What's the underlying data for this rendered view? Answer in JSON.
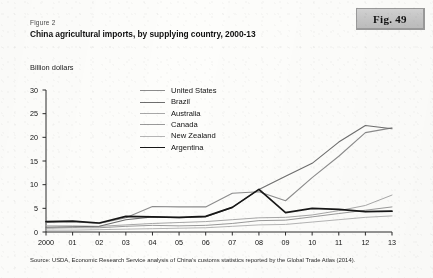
{
  "badge": {
    "label": "Fig. 49"
  },
  "figure_number": "Figure 2",
  "title": "China agricultural imports, by supplying country, 2000-13",
  "y_axis_title": "Billion dollars",
  "source_note": "Source: USDA, Economic Research Service analysis of China's customs statistics reported by the Global Trade Atlas (2014).",
  "chart_data": {
    "type": "line",
    "title": "China agricultural imports, by supplying country, 2000-13",
    "xlabel": "",
    "ylabel": "Billion dollars",
    "ylim": [
      0,
      30
    ],
    "yticks": [
      0,
      5,
      10,
      15,
      20,
      25,
      30
    ],
    "grid": false,
    "legend_position": "upper-left-inside",
    "x": [
      "2000",
      "01",
      "02",
      "03",
      "04",
      "05",
      "06",
      "07",
      "08",
      "09",
      "10",
      "11",
      "12",
      "13"
    ],
    "categories": [
      "2000",
      "01",
      "02",
      "03",
      "04",
      "05",
      "06",
      "07",
      "08",
      "09",
      "10",
      "11",
      "12",
      "13"
    ],
    "series": [
      {
        "name": "United States",
        "color": "#8c8c8c",
        "width": 1.1,
        "values": [
          2.0,
          2.2,
          1.8,
          3.0,
          5.4,
          5.3,
          5.3,
          8.2,
          8.5,
          6.6,
          11.5,
          16.0,
          21.0,
          22.0
        ]
      },
      {
        "name": "Brazil",
        "color": "#6e6e6e",
        "width": 1.1,
        "values": [
          1.0,
          1.1,
          1.2,
          2.6,
          3.2,
          3.0,
          3.2,
          5.2,
          9.0,
          11.8,
          14.5,
          19.0,
          22.5,
          21.8
        ]
      },
      {
        "name": "Australia",
        "color": "#a8a8a8",
        "width": 1.0,
        "values": [
          1.3,
          1.3,
          1.2,
          1.5,
          1.8,
          2.0,
          2.2,
          2.6,
          3.0,
          3.1,
          3.6,
          4.5,
          5.6,
          7.8
        ]
      },
      {
        "name": "Canada",
        "color": "#9a9a9a",
        "width": 1.0,
        "values": [
          0.8,
          0.9,
          0.9,
          1.2,
          1.4,
          1.3,
          1.4,
          1.8,
          2.4,
          2.5,
          3.2,
          3.9,
          4.6,
          5.3
        ]
      },
      {
        "name": "New Zealand",
        "color": "#b5b5b5",
        "width": 1.0,
        "values": [
          0.4,
          0.4,
          0.5,
          0.6,
          0.7,
          0.8,
          0.9,
          1.2,
          1.5,
          1.6,
          2.1,
          2.6,
          3.1,
          3.4
        ]
      },
      {
        "name": "Argentina",
        "color": "#171717",
        "width": 1.7,
        "values": [
          2.2,
          2.3,
          1.9,
          3.3,
          3.2,
          3.1,
          3.3,
          5.2,
          9.0,
          4.1,
          5.0,
          4.8,
          4.3,
          4.4
        ]
      }
    ]
  }
}
